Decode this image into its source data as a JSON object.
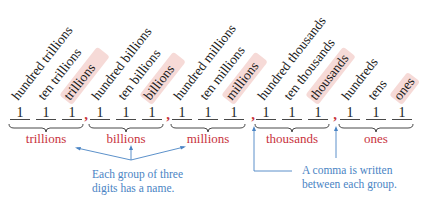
{
  "colors": {
    "group_label": "#c8323c",
    "callout": "#4a84c4",
    "highlight": "#f4d4d0",
    "text": "#1a1a1a"
  },
  "place_values": [
    {
      "label": "hundred trillions",
      "highlight": false
    },
    {
      "label": "ten trillions",
      "highlight": false
    },
    {
      "label": "trillions",
      "highlight": true
    },
    {
      "label": "hundred billions",
      "highlight": false
    },
    {
      "label": "ten billions",
      "highlight": false
    },
    {
      "label": "billions",
      "highlight": true
    },
    {
      "label": "hundred millions",
      "highlight": false
    },
    {
      "label": "ten millions",
      "highlight": false
    },
    {
      "label": "millions",
      "highlight": true
    },
    {
      "label": "hundred thousands",
      "highlight": false
    },
    {
      "label": "ten thousands",
      "highlight": false
    },
    {
      "label": "thousands",
      "highlight": true
    },
    {
      "label": "hundreds",
      "highlight": false
    },
    {
      "label": "tens",
      "highlight": false
    },
    {
      "label": "ones",
      "highlight": true
    }
  ],
  "digits": [
    "1",
    "1",
    "1",
    "1",
    "1",
    "1",
    "1",
    "1",
    "1",
    "1",
    "1",
    "1",
    "1",
    "1",
    "1"
  ],
  "commas": [
    ",",
    ",",
    ",",
    ","
  ],
  "groups": [
    {
      "label": "trillions"
    },
    {
      "label": "billions"
    },
    {
      "label": "millions"
    },
    {
      "label": "thousands"
    },
    {
      "label": "ones"
    }
  ],
  "callouts": {
    "group_names": {
      "line1": "Each group of three",
      "line2": "digits has a name."
    },
    "comma_note": {
      "line1": "A comma is written",
      "line2": "between each group."
    }
  }
}
